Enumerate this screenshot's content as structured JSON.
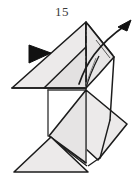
{
  "figure": {
    "kind": "origami-folding-diagram",
    "step_number": "15",
    "title": "15",
    "caption": "",
    "colors": {
      "paper_front": "#eceaea",
      "paper_front_shade": "#e4e2e2",
      "paper_back": "#ffffff",
      "outline": "#1c1c1c",
      "crease": "#6f6f6f",
      "arrow": "#1c1c1c",
      "chain_line": "#1c1c1c",
      "background": "#ffffff",
      "label": "#3a3a3a"
    },
    "annotations": [
      {
        "name": "step-number",
        "type": "text",
        "value": "15",
        "x": 62,
        "y": 15
      },
      {
        "name": "valley-fold-arrowhead",
        "type": "solid-triangle-arrowhead",
        "direction": "left",
        "points": "30,46 30,62 50,52"
      },
      {
        "name": "unfold-curved-arrow",
        "type": "curved-arrow",
        "direction": "up-right",
        "path": "M 78,82 C 86,62 96,44 124,26"
      },
      {
        "name": "center-chain-line",
        "type": "dash-dot-line",
        "x1": 86,
        "y1": 22,
        "x2": 86,
        "y2": 88
      }
    ],
    "panels": [
      {
        "name": "upper-left-flap",
        "fill": "paper_front",
        "points": "12,88 86,22 86,88"
      },
      {
        "name": "upper-right-flap",
        "fill": "paper_front",
        "points": "86,22 113,56 86,88"
      },
      {
        "name": "upper-inner-flap",
        "fill": "paper_front_shade",
        "points": "44,88 86,50 86,88"
      },
      {
        "name": "middle-open-panel",
        "fill": "paper_back",
        "points": "44,90 86,90 86,136 44,136"
      },
      {
        "name": "right-lower-flap",
        "fill": "paper_front",
        "points": "86,90 126,122 97,160 86,150"
      },
      {
        "name": "center-lower-flap",
        "fill": "paper_front_shade",
        "points": "48,136 86,90 86,163 48,136"
      },
      {
        "name": "bottom-left-flap",
        "fill": "paper_front",
        "points": "15,172 86,172 51,137"
      }
    ]
  }
}
